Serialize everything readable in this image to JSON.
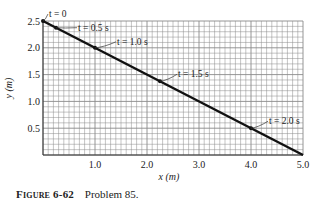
{
  "chart_data": {
    "type": "line",
    "title": "",
    "xlabel": "x (m)",
    "ylabel": "y (m)",
    "xlim": [
      0,
      5.0
    ],
    "ylim": [
      0,
      2.5
    ],
    "x_ticks": [
      "1.0",
      "2.0",
      "3.0",
      "4.0",
      "5.0"
    ],
    "x_tick_values": [
      1,
      2,
      3,
      4,
      5
    ],
    "y_ticks": [
      "0.5",
      "1.0",
      "1.5",
      "2.0",
      "2.5"
    ],
    "y_tick_values": [
      0.5,
      1.0,
      1.5,
      2.0,
      2.5
    ],
    "grid": true,
    "grid_minor_step": 0.1,
    "legend": "none",
    "series": [
      {
        "name": "path",
        "x": [
          0,
          5.0
        ],
        "y": [
          2.5,
          0
        ],
        "color": "#111111"
      }
    ],
    "points": [
      {
        "label": "t = 0",
        "x": 0,
        "y": 2.5
      },
      {
        "label": "t = 0.5 s",
        "x": 0.25,
        "y": 2.375
      },
      {
        "label": "t = 1.0 s",
        "x": 1.0,
        "y": 2.0
      },
      {
        "label": "t = 1.5 s",
        "x": 2.25,
        "y": 1.375
      },
      {
        "label": "t = 2.0 s",
        "x": 4.0,
        "y": 0.5
      }
    ]
  },
  "caption": {
    "label": "Figure 6-62",
    "text": "Problem 85."
  },
  "colors": {
    "grid": "#8a8a8a",
    "line": "#111111",
    "text": "#222222"
  }
}
